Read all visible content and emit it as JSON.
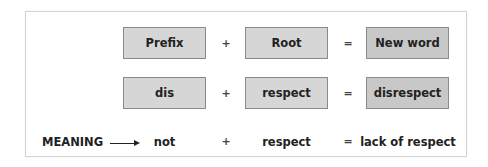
{
  "diagram": {
    "row1": {
      "prefix": "Prefix",
      "op1": "+",
      "root": "Root",
      "op2": "=",
      "result": "New word"
    },
    "row2": {
      "prefix": "dis",
      "op1": "+",
      "root": "respect",
      "op2": "=",
      "result": "disrespect"
    },
    "row3": {
      "label": "MEANING",
      "arrow": "arrow-right",
      "prefix": "not",
      "op1": "+",
      "root": "respect",
      "op2": "=",
      "result": "lack of respect"
    },
    "colors": {
      "box_fill": "#d6d6d6",
      "result_fill": "#c8c8c8",
      "box_border": "#8a8a8a",
      "frame_border": "#d4d4d4"
    }
  }
}
